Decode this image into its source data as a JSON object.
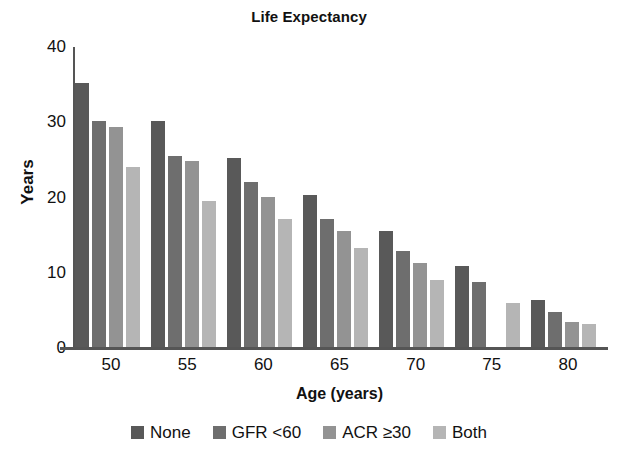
{
  "chart_data": {
    "type": "bar",
    "title": "Life Expectancy",
    "xlabel": "Age (years)",
    "ylabel": "Years",
    "categories": [
      "50",
      "55",
      "60",
      "65",
      "70",
      "75",
      "80"
    ],
    "ylim": [
      0,
      40
    ],
    "yticks": [
      0,
      10,
      20,
      30,
      40
    ],
    "xtick_labels": [
      "50",
      "55",
      "60",
      "65",
      "70",
      "75",
      "80"
    ],
    "grid": false,
    "legend_position": "bottom",
    "series": [
      {
        "name": "None",
        "color": "#595959",
        "values": [
          35.2,
          30.2,
          25.2,
          20.3,
          15.5,
          10.9,
          6.4
        ]
      },
      {
        "name": "GFR <60",
        "color": "#6e6e6e",
        "values": [
          30.2,
          25.5,
          22.0,
          17.2,
          12.9,
          8.8,
          4.8
        ]
      },
      {
        "name": "ACR ≥30",
        "color": "#939393",
        "values": [
          29.4,
          24.8,
          20.1,
          15.6,
          11.3,
          0,
          3.5
        ]
      },
      {
        "name": "Both",
        "color": "#b5b5b5",
        "values": [
          24.1,
          19.6,
          17.1,
          13.3,
          9.1,
          6.0,
          3.2
        ]
      }
    ]
  },
  "axis": {
    "axis_color": "#555555"
  }
}
